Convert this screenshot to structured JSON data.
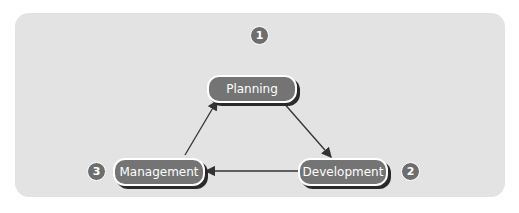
{
  "diagram": {
    "type": "cycle",
    "nodes": [
      {
        "id": "planning",
        "label": "Planning",
        "number": "1"
      },
      {
        "id": "development",
        "label": "Development",
        "number": "2"
      },
      {
        "id": "management",
        "label": "Management",
        "number": "3"
      }
    ],
    "edges": [
      {
        "from": "planning",
        "to": "development"
      },
      {
        "from": "development",
        "to": "management"
      },
      {
        "from": "management",
        "to": "planning"
      }
    ],
    "colors": {
      "panel": "#e3e3e3",
      "node": "#747474",
      "badge": "#6e6e6e",
      "arrow": "#333333"
    }
  }
}
